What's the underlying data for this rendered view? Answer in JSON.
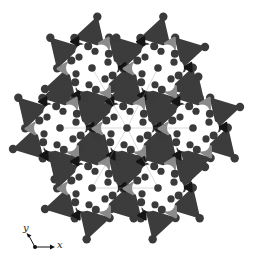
{
  "figure": {
    "type": "crystal-structure-projection",
    "background": "#ffffff",
    "colors": {
      "tetra_dark": "#3c3c3c",
      "tetra_mid": "#8a8a8a",
      "tetra_black": "#151515",
      "atom": "#3a3a3a",
      "cavity": "#ffffff",
      "bond_line": "#9a9a9a"
    },
    "cages": [
      {
        "cx": 92,
        "cy": 68
      },
      {
        "cx": 158,
        "cy": 68
      },
      {
        "cx": 60,
        "cy": 128
      },
      {
        "cx": 127,
        "cy": 128
      },
      {
        "cx": 193,
        "cy": 128
      },
      {
        "cx": 92,
        "cy": 188
      },
      {
        "cx": 158,
        "cy": 188
      }
    ],
    "cage_radius": 30
  },
  "axes": {
    "x_label": "x",
    "y_label": "y"
  }
}
